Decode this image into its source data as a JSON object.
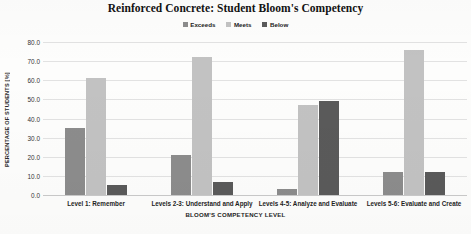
{
  "chart_data": {
    "type": "bar",
    "title": "Reinforced Concrete: Student Bloom's Competency",
    "xlabel": "BLOOM'S COMPETENCY LEVEL",
    "ylabel": "PERCENTAGE OF STUDENTS [%]",
    "ylim": [
      0,
      80
    ],
    "yticks": [
      "0.0",
      "10.0",
      "20.0",
      "30.0",
      "40.0",
      "50.0",
      "60.0",
      "70.0",
      "80.0"
    ],
    "ytick_values": [
      0,
      10,
      20,
      30,
      40,
      50,
      60,
      70,
      80
    ],
    "grid": true,
    "legend_position": "top-center",
    "categories": [
      "Level 1: Remember",
      "Levels 2-3: Understand and Apply",
      "Levels 4-5: Analyze and Evaluate",
      "Levels 5-6: Evaluate and Create"
    ],
    "series": [
      {
        "name": "Exceeds",
        "color": "#8c8c8c",
        "values": [
          35,
          21,
          3,
          12
        ]
      },
      {
        "name": "Meets",
        "color": "#c2c2c2",
        "values": [
          61,
          72,
          47,
          76
        ]
      },
      {
        "name": "Below",
        "color": "#5a5a5a",
        "values": [
          5,
          7,
          49,
          12
        ]
      }
    ]
  }
}
